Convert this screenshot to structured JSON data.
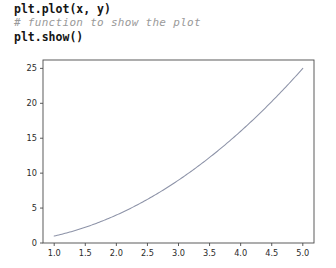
{
  "code": {
    "lines": [
      {
        "text": "plt.plot(x, y)",
        "kind": "statement"
      },
      {
        "text": "# function to show the plot",
        "kind": "comment"
      },
      {
        "text": "plt.show()",
        "kind": "statement"
      }
    ]
  },
  "colors": {
    "line": "#8d93a8",
    "axis": "#4a4a4a",
    "text": "#2a2a2a",
    "comment": "#9a9a9a",
    "background": "#ffffff"
  },
  "chart_data": {
    "type": "line",
    "title": "",
    "xlabel": "",
    "ylabel": "",
    "xlim": [
      0.82,
      5.18
    ],
    "ylim": [
      0.0,
      26.2
    ],
    "grid": false,
    "legend": false,
    "xticks": [
      "1.0",
      "1.5",
      "2.0",
      "2.5",
      "3.0",
      "3.5",
      "4.0",
      "4.5",
      "5.0"
    ],
    "xtick_values": [
      1.0,
      1.5,
      2.0,
      2.5,
      3.0,
      3.5,
      4.0,
      4.5,
      5.0
    ],
    "yticks": [
      "0",
      "5",
      "10",
      "15",
      "20",
      "25"
    ],
    "ytick_values": [
      0,
      5,
      10,
      15,
      20,
      25
    ],
    "series": [
      {
        "name": "y = x^2",
        "x": [
          1.0,
          1.5,
          2.0,
          2.5,
          3.0,
          3.5,
          4.0,
          4.5,
          5.0
        ],
        "values": [
          1,
          2.25,
          4,
          6.25,
          9,
          12.25,
          16,
          20.25,
          25
        ]
      }
    ]
  }
}
